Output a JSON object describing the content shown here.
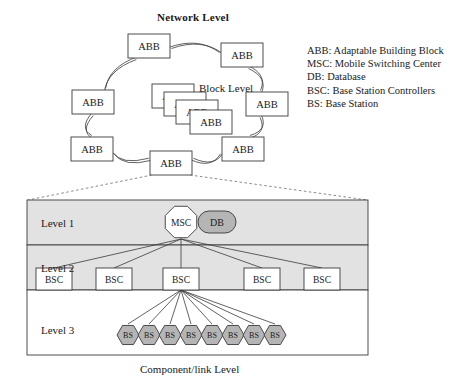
{
  "titles": {
    "network_level": "Network Level",
    "block_level": "Block Level",
    "component_caption": "Component/link Level"
  },
  "legend": {
    "items": [
      "ABB: Adaptable Building Block",
      "MSC: Mobile Switching Center",
      "DB: Database",
      "BSC: Base Station Controllers",
      "BS: Base Station"
    ]
  },
  "network_ring": {
    "node_label": "ABB",
    "nodes": [
      {
        "id": "abb-top",
        "label": "ABB",
        "x": 128,
        "y": 34,
        "w": 42,
        "h": 24
      },
      {
        "id": "abb-top-right",
        "label": "ABB",
        "x": 221,
        "y": 43,
        "w": 42,
        "h": 24
      },
      {
        "id": "abb-right",
        "label": "ABB",
        "x": 246,
        "y": 92,
        "w": 42,
        "h": 24
      },
      {
        "id": "abb-bottom-right",
        "label": "ABB",
        "x": 222,
        "y": 137,
        "w": 42,
        "h": 24
      },
      {
        "id": "abb-bottom",
        "label": "ABB",
        "x": 150,
        "y": 151,
        "w": 42,
        "h": 24
      },
      {
        "id": "abb-bottom-left",
        "label": "ABB",
        "x": 71,
        "y": 137,
        "w": 42,
        "h": 24
      },
      {
        "id": "abb-left",
        "label": "ABB",
        "x": 72,
        "y": 90,
        "w": 42,
        "h": 24
      }
    ]
  },
  "block_level": {
    "node_label": "ABB",
    "cards": [
      {
        "id": "block-abb-1",
        "label": "ABB",
        "x": 152,
        "y": 84,
        "w": 42,
        "h": 24
      },
      {
        "id": "block-abb-2",
        "label": "ABB",
        "x": 164,
        "y": 92,
        "w": 42,
        "h": 24
      },
      {
        "id": "block-abb-3",
        "label": "ABB",
        "x": 176,
        "y": 100,
        "w": 42,
        "h": 24
      },
      {
        "id": "block-abb-4",
        "label": "ABB",
        "x": 190,
        "y": 110,
        "w": 42,
        "h": 24
      }
    ]
  },
  "panel": {
    "bounds": {
      "x": 27,
      "y": 200,
      "w": 341,
      "h": 155
    },
    "bands": [
      {
        "id": "level-1",
        "label": "Level 1",
        "y": 200,
        "h": 45,
        "fill": "#e2e2e2"
      },
      {
        "id": "level-2",
        "label": "Level 2",
        "y": 245,
        "h": 45,
        "fill": "#e2e2e2"
      },
      {
        "id": "level-3",
        "label": "Level 3",
        "y": 290,
        "h": 65,
        "fill": "#ffffff"
      }
    ],
    "msc": {
      "label": "MSC",
      "cx": 181,
      "cy": 222,
      "r": 17,
      "fill": "#ffffff"
    },
    "db": {
      "label": "DB",
      "x": 198,
      "y": 211,
      "w": 38,
      "h": 22,
      "fill": "#b5b5b5"
    },
    "bsc": {
      "label": "BSC",
      "nodes": [
        {
          "id": "bsc-1",
          "x": 36,
          "y": 268,
          "w": 36,
          "h": 22
        },
        {
          "id": "bsc-2",
          "x": 96,
          "y": 268,
          "w": 36,
          "h": 22
        },
        {
          "id": "bsc-3",
          "x": 163,
          "y": 268,
          "w": 36,
          "h": 22
        },
        {
          "id": "bsc-4",
          "x": 244,
          "y": 268,
          "w": 36,
          "h": 22
        },
        {
          "id": "bsc-5",
          "x": 304,
          "y": 268,
          "w": 36,
          "h": 22
        }
      ]
    },
    "bs": {
      "label": "BS",
      "fill": "#b5b5b5",
      "count": 8,
      "start_x": 128,
      "step": 21,
      "cy": 335,
      "rx": 11,
      "ry": 11
    }
  },
  "colors": {
    "band_gray": "#e2e2e2",
    "node_gray": "#b5b5b5",
    "stroke": "#3a3a3a",
    "text": "#1a1a1a"
  }
}
